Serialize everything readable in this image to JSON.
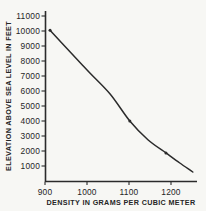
{
  "figure": {
    "background": "#f7f7f4",
    "ink": "#2b2b2b"
  },
  "chart_data": {
    "type": "line",
    "title": "",
    "xlabel": "DENSITY IN GRAMS PER CUBIC METER",
    "ylabel": "ELEVATION ABOVE SEA LEVEL IN FEET",
    "xlim": [
      900,
      1262
    ],
    "ylim": [
      0,
      11000
    ],
    "x_ticks": [
      900,
      1000,
      1100,
      1200
    ],
    "y_ticks": [
      1000,
      2000,
      3000,
      4000,
      5000,
      6000,
      7000,
      8000,
      9000,
      10000,
      11000
    ],
    "grid": false,
    "legend": null,
    "series": [
      {
        "name": "elevation-vs-density",
        "points": [
          [
            912,
            10050
          ],
          [
            960,
            8600
          ],
          [
            1007,
            7200
          ],
          [
            1055,
            5800
          ],
          [
            1102,
            4000
          ],
          [
            1145,
            2750
          ],
          [
            1188,
            1870
          ],
          [
            1221,
            1200
          ],
          [
            1252,
            600
          ]
        ]
      }
    ],
    "marked_points": [
      [
        912,
        10050
      ],
      [
        1102,
        4000
      ],
      [
        1188,
        1870
      ]
    ]
  }
}
